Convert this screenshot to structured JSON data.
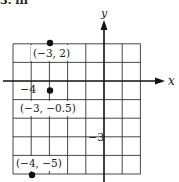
{
  "problem": {
    "label": "3. iii"
  },
  "axes": {
    "x_label": "x",
    "y_label": "y",
    "tick_labels": [
      {
        "text": "−4",
        "axis": "x",
        "value": -4
      },
      {
        "text": "−3",
        "axis": "y",
        "value": -3
      }
    ]
  },
  "grid": {
    "x_range": [
      -5,
      2
    ],
    "y_range": [
      -5,
      2
    ],
    "step": 1
  },
  "points": [
    {
      "label": "(−3, 2)",
      "x": -3,
      "y": 2
    },
    {
      "label": "(−3, −0.5)",
      "x": -3,
      "y": -0.5
    },
    {
      "label": "(−4, −5)",
      "x": -4,
      "y": -5
    }
  ],
  "colors": {
    "line": "#1a1a1a",
    "grid": "#333333",
    "background": "#ffffff"
  }
}
